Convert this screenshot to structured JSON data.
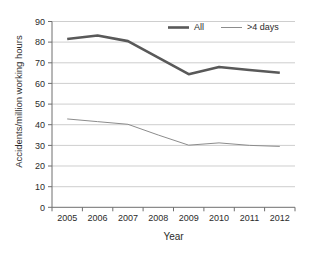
{
  "chart_data": {
    "type": "line",
    "title": "",
    "xlabel": "Year",
    "ylabel": "Accidents/million working hours",
    "categories": [
      "2005",
      "2006",
      "2007",
      "2008",
      "2009",
      "2010",
      "2011",
      "2012"
    ],
    "x": [
      2005,
      2006,
      2007,
      2008,
      2009,
      2010,
      2011,
      2012
    ],
    "series": [
      {
        "name": "All",
        "values": [
          81.5,
          83.2,
          80.5,
          72.5,
          64.5,
          68.0,
          66.5,
          65.2
        ],
        "color": "#595959",
        "line_width": 2.6
      },
      {
        "name": ">4 days",
        "values": [
          42.8,
          41.5,
          40.2,
          35.0,
          30.1,
          31.2,
          30.0,
          29.5
        ],
        "color": "#8c8c8c",
        "line_width": 1.0
      }
    ],
    "ylim": [
      0,
      90
    ],
    "yticks": [
      0,
      10,
      20,
      30,
      40,
      50,
      60,
      70,
      80,
      90
    ],
    "ytick_labels": [
      "0",
      "10",
      "20",
      "30",
      "40",
      "50",
      "60",
      "70",
      "80",
      "90"
    ],
    "xtick_labels": [
      "2005",
      "2006",
      "2007",
      "2008",
      "2009",
      "2010",
      "2011",
      "2012"
    ],
    "grid": true,
    "grid_axis": "y",
    "legend": [
      "All",
      ">4 days"
    ],
    "legend_position": "top-center-right",
    "background_color": "#ffffff",
    "grid_color": "#b9b9b9",
    "axis_color": "#6e6e6e"
  },
  "legend": {
    "items": [
      {
        "label": "All"
      },
      {
        "label": ">4 days"
      }
    ]
  },
  "axes": {
    "y_title": "Accidents/million working hours",
    "x_title": "Year"
  }
}
